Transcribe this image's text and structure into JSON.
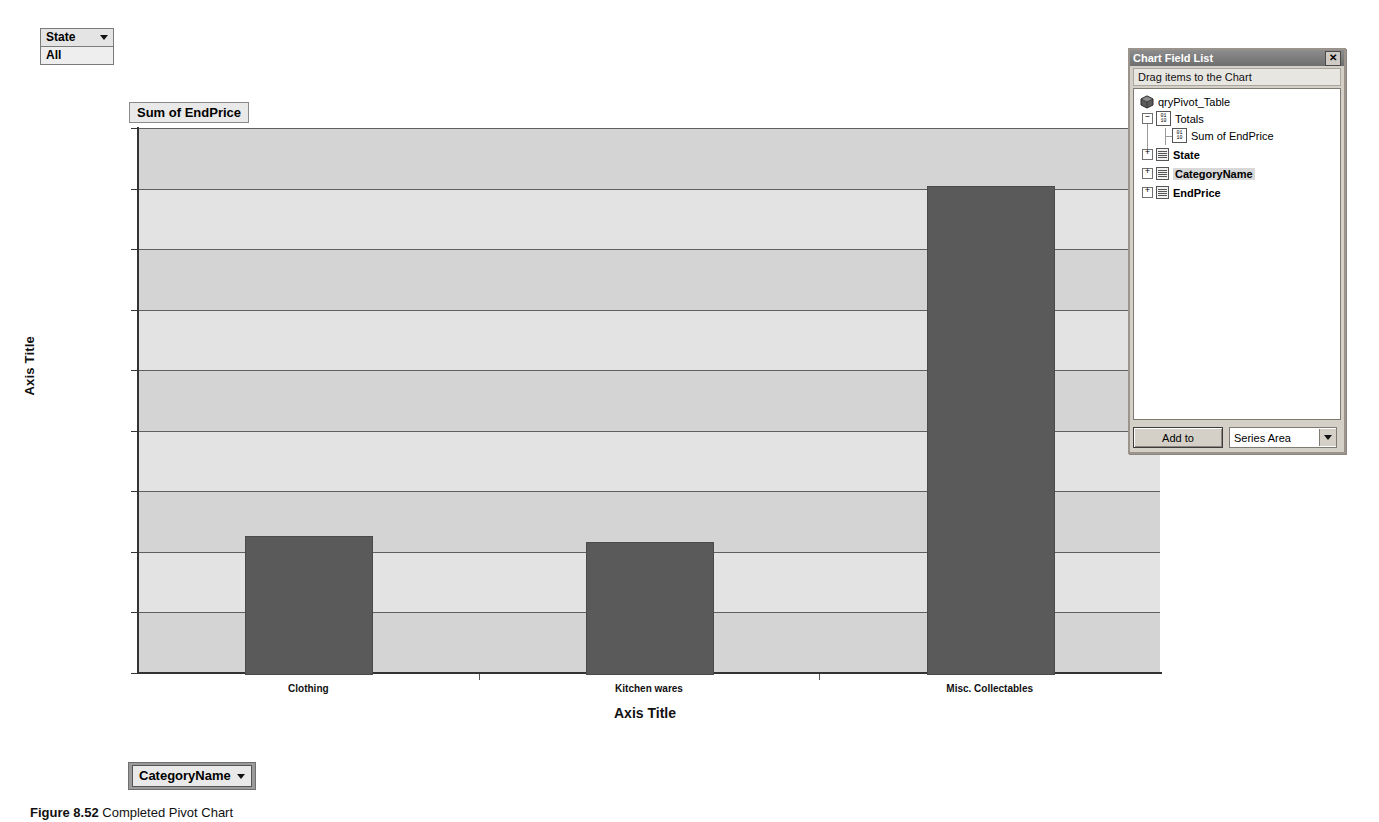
{
  "filter": {
    "field_label": "State",
    "value_label": "All",
    "dropdown_icon": "chevron-down-icon"
  },
  "series_box": {
    "label": "Sum of EndPrice"
  },
  "category_field": {
    "label": "CategoryName",
    "dropdown_icon": "chevron-down-icon"
  },
  "caption": {
    "figure_number": "Figure 8.52",
    "text": "Completed Pivot Chart"
  },
  "field_list": {
    "title": "Chart Field List",
    "close_icon": "close-icon",
    "subtitle": "Drag items to the Chart",
    "root": "qryPivot_Table",
    "nodes": [
      {
        "label": "Totals",
        "icon": "totals-icon",
        "expander": "minus",
        "bold": false,
        "highlighted": false
      },
      {
        "label": "Sum of EndPrice",
        "icon": "totals-icon",
        "expander": "none",
        "bold": false,
        "highlighted": false
      },
      {
        "label": "State",
        "icon": "field-icon",
        "expander": "plus",
        "bold": true,
        "highlighted": false
      },
      {
        "label": "CategoryName",
        "icon": "field-icon",
        "expander": "plus",
        "bold": true,
        "highlighted": true
      },
      {
        "label": "EndPrice",
        "icon": "field-icon",
        "expander": "plus",
        "bold": true,
        "highlighted": false
      }
    ],
    "add_to_button": "Add to",
    "area_select_value": "Series Area",
    "area_select_icon": "chevron-down-icon"
  },
  "chart_data": {
    "type": "bar",
    "title": "Sum of EndPrice",
    "categories": [
      "Clothing",
      "Kitchen wares",
      "Misc. Collectables"
    ],
    "values": [
      113.0,
      108.0,
      402.0
    ],
    "series": [
      {
        "name": "Sum of EndPrice",
        "values": [
          113.0,
          108.0,
          402.0
        ]
      }
    ],
    "xlabel": "Axis Title",
    "ylabel": "Axis Title",
    "ylim": [
      0,
      450
    ],
    "ytick_values": [
      0,
      50,
      100,
      150,
      200,
      250,
      300,
      350,
      400,
      450
    ],
    "ytick_labels": [
      "$0.00",
      "$50.00",
      "$100.00",
      "$150.00",
      "$200.00",
      "$250.00",
      "$300.00",
      "$350.00",
      "$400.00",
      "$450.00"
    ],
    "grid": true,
    "legend": "none",
    "bar_color": "#5a5a5a",
    "plot_bg": "#d4d4d4",
    "band_color": "#e3e3e3"
  }
}
